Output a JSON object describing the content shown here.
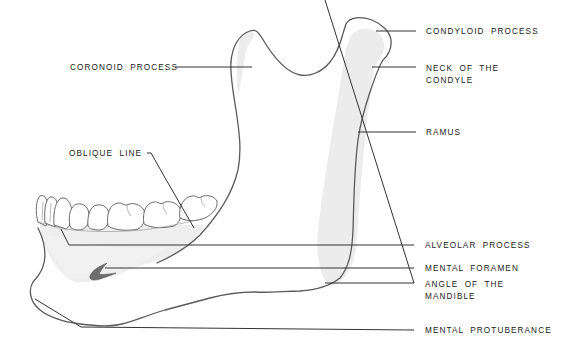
{
  "diagram": {
    "colors": {
      "background": "#ffffff",
      "outline": "#5a5a5a",
      "leader": "#333333",
      "shading": "#ececec",
      "foramen": "#6e6e6e",
      "text": "#222222"
    },
    "labels": {
      "coronoid_process": {
        "lines": [
          "CORONOID PROCESS"
        ]
      },
      "condyloid_process": {
        "lines": [
          "CONDYLOID PROCESS"
        ]
      },
      "neck_of_condyle": {
        "lines": [
          "NECK OF THE",
          "CONDYLE"
        ]
      },
      "ramus": {
        "lines": [
          "RAMUS"
        ]
      },
      "oblique_line": {
        "lines": [
          "OBLIQUE LINE"
        ]
      },
      "alveolar_process": {
        "lines": [
          "ALVEOLAR PROCESS"
        ]
      },
      "mental_foramen": {
        "lines": [
          "MENTAL FORAMEN"
        ]
      },
      "angle_of_mandible": {
        "lines": [
          "ANGLE OF THE",
          "MANDIBLE"
        ]
      },
      "mental_protuberance": {
        "lines": [
          "MENTAL PROTUBERANCE"
        ]
      }
    }
  }
}
